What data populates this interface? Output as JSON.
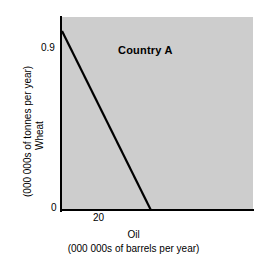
{
  "chart_data": {
    "type": "line",
    "title": "",
    "annotations": [
      {
        "text": "Country A",
        "x": 11.5,
        "y": 0.8
      }
    ],
    "xlabel": "Oil",
    "xlabel_units": "(000 000s of  barrels per year)",
    "ylabel": "Wheat",
    "ylabel_units": "(000 000s of tonnes per year)",
    "xlim": [
      0,
      43
    ],
    "ylim": [
      0,
      0.97
    ],
    "xticks": [
      20
    ],
    "xticklabels": [
      "20"
    ],
    "yticks": [
      0,
      0.9
    ],
    "yticklabels": [
      "0",
      "0.9"
    ],
    "grid": false,
    "legend": false,
    "plot_background": "#cdcdcd",
    "line_color": "#000000",
    "series": [
      {
        "name": "Production possibility frontier",
        "x": [
          0,
          20
        ],
        "y": [
          0.9,
          0
        ]
      }
    ]
  },
  "axis": {
    "y_tick_max": "0.9",
    "y_tick_zero": "0",
    "x_tick_20": "20",
    "y_title": "Wheat",
    "y_subtitle": "(000 000s of tonnes per year)",
    "x_title": "Oil",
    "x_subtitle": "(000 000s of  barrels per year)"
  },
  "plot": {
    "country_label": "Country A"
  },
  "colors": {
    "plot_fill": "#cdcdcd",
    "axis": "#000000",
    "frontier": "#000000",
    "page_background": "#ffffff"
  }
}
